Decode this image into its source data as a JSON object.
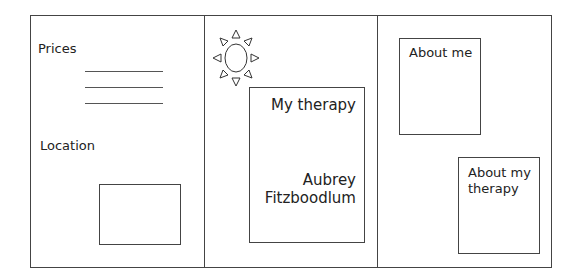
{
  "left_panel": {
    "prices_label": "Prices",
    "price_lines": 3,
    "location_label": "Location"
  },
  "middle_panel": {
    "logo_icon": "sun-icon",
    "title": "My therapy",
    "name_line1": "Aubrey",
    "name_line2": "Fitzboodlum"
  },
  "right_panel": {
    "about_me_label": "About me",
    "about_therapy_line1": "About my",
    "about_therapy_line2": "therapy"
  }
}
